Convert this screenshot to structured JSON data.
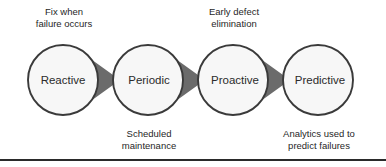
{
  "diagram": {
    "colors": {
      "circle_fill": "#f7f7f7",
      "circle_stroke": "#3a3a3a",
      "arrow_fill": "#6b6b6b",
      "text": "#1f1f1f",
      "rule": "#2a2a2a",
      "background": "#ffffff"
    },
    "stages": [
      {
        "label": "Reactive",
        "note_position": "above",
        "note_lines": [
          "Fix when",
          "failure occurs"
        ]
      },
      {
        "label": "Periodic",
        "note_position": "below",
        "note_lines": [
          "Scheduled",
          "maintenance"
        ]
      },
      {
        "label": "Proactive",
        "note_position": "above",
        "note_lines": [
          "Early defect",
          "elimination"
        ]
      },
      {
        "label": "Predictive",
        "note_position": "below",
        "note_lines": [
          "Analytics used to",
          "predict failures"
        ]
      }
    ],
    "arrows": [
      {
        "name": "arrow-reactive-to-periodic"
      },
      {
        "name": "arrow-periodic-to-proactive"
      },
      {
        "name": "arrow-proactive-to-predictive"
      }
    ]
  }
}
